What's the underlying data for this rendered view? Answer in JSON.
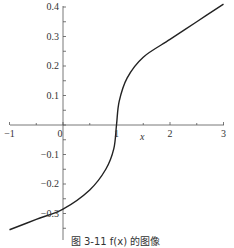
{
  "chart_data": {
    "type": "line",
    "title": "",
    "xlabel": "x",
    "ylabel": "",
    "xlim": [
      -1,
      3
    ],
    "ylim": [
      -0.36,
      0.42
    ],
    "grid": false,
    "x_ticks": [
      -1,
      0,
      1,
      2,
      3
    ],
    "x_tick_labels": [
      "−1",
      "0",
      "1",
      "2",
      "3"
    ],
    "y_ticks": [
      0.4,
      0.3,
      0.2,
      0.1,
      -0.1,
      -0.2,
      -0.3
    ],
    "y_tick_labels": [
      "0.4",
      "0.3",
      "0.2",
      "0.1",
      "−0.1",
      "−0.2",
      "−0.3"
    ],
    "series": [
      {
        "name": "f(x)",
        "x": [
          -1,
          -0.5,
          0,
          0.5,
          0.8,
          0.95,
          1,
          1.05,
          1.2,
          1.5,
          2,
          2.5,
          3
        ],
        "y": [
          -0.355,
          -0.32,
          -0.285,
          -0.22,
          -0.15,
          -0.08,
          0,
          0.08,
          0.16,
          0.23,
          0.29,
          0.35,
          0.41
        ]
      }
    ],
    "caption": "图 3-11  f(x) 的图像"
  }
}
